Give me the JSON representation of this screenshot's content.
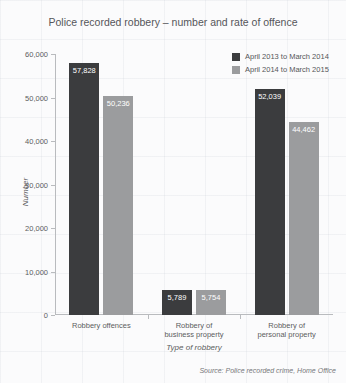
{
  "chart_data": {
    "type": "bar",
    "title": "Police recorded robbery – number and rate of offence",
    "xlabel": "Type of robbery",
    "ylabel": "Number",
    "categories": [
      "Robbery offences",
      "Robbery of business property",
      "Robbery of personal property"
    ],
    "category_lines": [
      [
        "Robbery offences"
      ],
      [
        "Robbery of",
        "business property"
      ],
      [
        "Robbery of",
        "personal property"
      ]
    ],
    "series": [
      {
        "name": "April 2013 to March 2014",
        "color": "#3b3c3e",
        "values": [
          57828,
          5789,
          52039
        ],
        "labels": [
          "57,828",
          "5,789",
          "52,039"
        ]
      },
      {
        "name": "April 2014 to March 2015",
        "color": "#9b9c9e",
        "values": [
          50236,
          5754,
          44462
        ],
        "labels": [
          "50,236",
          "5,754",
          "44,462"
        ]
      }
    ],
    "ylim": [
      0,
      60000
    ],
    "yticks": [
      0,
      10000,
      20000,
      30000,
      40000,
      50000,
      60000
    ],
    "ytick_labels": [
      "0",
      "10,000",
      "20,000",
      "30,000",
      "40,000",
      "50,000",
      "60,000"
    ],
    "grid": false,
    "legend_position": "top-right",
    "source": "Source: Police recorded crime, Home Office"
  }
}
